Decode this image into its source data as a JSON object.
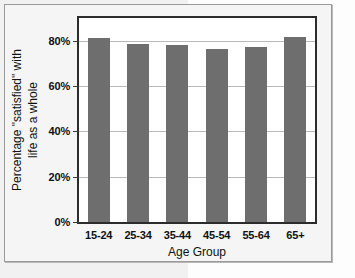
{
  "figure": {
    "background_color": "#f5f5f5",
    "border_color": "#9a9a9a",
    "plot_background_color": "#ffffff",
    "plot_border_color": "#2c2c2c",
    "bar_color": "#6e6e6e",
    "gridline_color": "#b9b9b9"
  },
  "chart_data": {
    "type": "bar",
    "title": "",
    "xlabel": "Age Group",
    "ylabel": "Percentage \"satisfied\" with life as a whole",
    "ylabel_lines": [
      "Percentage \"satisfied\" with",
      "life as a whole"
    ],
    "categories": [
      "15-24",
      "25-34",
      "35-44",
      "45-54",
      "55-64",
      "65+"
    ],
    "values": [
      81,
      78.5,
      78,
      76.5,
      77,
      81.5
    ],
    "ylim": [
      0,
      90
    ],
    "yticks": [
      0,
      20,
      40,
      60,
      80
    ],
    "ytick_labels": [
      "0%",
      "20%",
      "40%",
      "60%",
      "80%"
    ],
    "grid": true,
    "legend": false,
    "series": [
      {
        "name": "Percentage satisfied",
        "values": [
          81,
          78.5,
          78,
          76.5,
          77,
          81.5
        ]
      }
    ]
  }
}
